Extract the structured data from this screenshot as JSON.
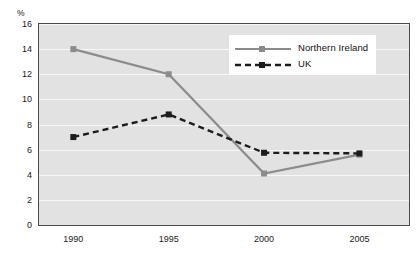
{
  "chart_data": {
    "type": "line",
    "title": "",
    "subtitle": "",
    "xlabel": "",
    "ylabel": "%",
    "unit_label": "%",
    "x": [
      1990,
      1995,
      2000,
      2005
    ],
    "categories": [
      "1990",
      "1995",
      "2000",
      "2005"
    ],
    "xtick_labels": [
      "1990",
      "1995",
      "2000",
      "2005"
    ],
    "ytick_labels": [
      "0",
      "2",
      "4",
      "6",
      "8",
      "10",
      "12",
      "14",
      "16"
    ],
    "yticks": [
      0,
      2,
      4,
      6,
      8,
      10,
      12,
      14,
      16
    ],
    "ylim": [
      0,
      16
    ],
    "xlim": [
      1988.2,
      2007.6
    ],
    "grid": true,
    "grid_axis": "y",
    "grid_color": "#f7f7f7",
    "plot_background": "#e2e2e2",
    "frame_color": "#4a4a4a",
    "legend_position": "upper-right-inside",
    "series": [
      {
        "name": "Northern Ireland",
        "values": [
          14.0,
          12.0,
          4.1,
          5.6
        ],
        "color": "#8c8c8c",
        "line_style": "solid",
        "marker": "square"
      },
      {
        "name": "UK",
        "values": [
          7.0,
          8.8,
          5.75,
          5.7
        ],
        "color": "#1c1c1c",
        "line_style": "dashed",
        "marker": "square"
      }
    ]
  },
  "legend": {
    "entries": [
      {
        "label": "Northern Ireland"
      },
      {
        "label": "UK"
      }
    ]
  }
}
